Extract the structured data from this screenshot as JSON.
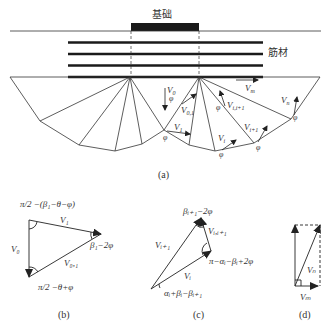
{
  "labels": {
    "footing": "基础",
    "reinforcement": "筋材"
  },
  "captions": {
    "a": "(a)",
    "b": "(b)",
    "c": "(c)",
    "d": "(d)"
  },
  "diagram_a": {
    "V0": "V",
    "V0_sub": "0",
    "V01": "V",
    "V01_sub": "0,1",
    "V1": "V",
    "V1_sub": "1",
    "Vi": "V",
    "Vi_sub": "i",
    "Vii1": "V",
    "Vii1_sub": "i,i+1",
    "Vi1": "V",
    "Vi1_sub": "i+1",
    "Vn": "V",
    "Vn_sub": "n",
    "Vm": "V",
    "Vm_sub": "m",
    "phi": "φ"
  },
  "diagram_b": {
    "top_angle": "π/2 −(β₁−θ−φ)",
    "right_angle": "β₁−2φ",
    "bottom_angle": "π/2 −θ+φ",
    "V0": "V₀",
    "V1": "V₁",
    "V01": "V₀,₁"
  },
  "diagram_c": {
    "top_angle": "βᵢ₊₁−2φ",
    "right_angle": "π−αᵢ−βᵢ+2φ",
    "bottom_angle": "αᵢ+βᵢ−βᵢ₊₁",
    "Vi1": "Vᵢ₊₁",
    "Vii1": "Vᵢ,ᵢ₊₁",
    "Vi": "Vᵢ"
  },
  "diagram_d": {
    "Vn": "Vₙ",
    "Vm": "Vₘ"
  }
}
